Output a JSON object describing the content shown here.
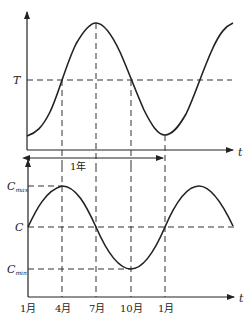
{
  "top_chart": {
    "axis_x_label": "t",
    "threshold_label": "T",
    "period_label": "1年"
  },
  "bottom_chart": {
    "axis_x_label": "t",
    "c_max_label": "C",
    "c_max_sub": "max",
    "c_label": "C",
    "c_min_label": "C",
    "c_min_sub": "min",
    "months": [
      "1月",
      "4月",
      "7月",
      "10月",
      "1月"
    ]
  },
  "colors": {
    "line": "#222222",
    "dash": "#333333"
  }
}
